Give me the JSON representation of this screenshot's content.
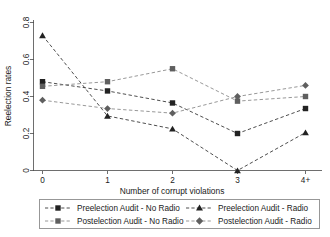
{
  "chart_data": {
    "type": "line",
    "title": "",
    "xlabel": "Number of corrupt violations",
    "ylabel": "Reelection rates",
    "categories": [
      "0",
      "1",
      "2",
      "3",
      "4+"
    ],
    "x": [
      0,
      1,
      2,
      3,
      4
    ],
    "xtick_labels": [
      "0",
      "1",
      "2",
      "3",
      "4+"
    ],
    "ytick_labels": [
      "0",
      "0.2",
      "0.4",
      "0.6",
      "0.8"
    ],
    "ytick_values": [
      0,
      0.2,
      0.4,
      0.6,
      0.8
    ],
    "ylim": [
      0,
      0.8
    ],
    "grid": false,
    "legend_position": "bottom",
    "series": [
      {
        "name": "Preelection Audit - No Radio",
        "marker": "square",
        "tone": "dark",
        "values": [
          0.48,
          0.43,
          0.365,
          0.2,
          0.335
        ]
      },
      {
        "name": "Preelection Audit - Radio",
        "marker": "triangle",
        "tone": "dark",
        "values": [
          0.73,
          0.295,
          0.225,
          0.0,
          0.205
        ]
      },
      {
        "name": "Postelection Audit - No Radio",
        "marker": "square",
        "tone": "light",
        "values": [
          0.455,
          0.48,
          0.55,
          0.375,
          0.4
        ]
      },
      {
        "name": "Postelection Audit - Radio",
        "marker": "diamond",
        "tone": "light",
        "values": [
          0.38,
          0.335,
          0.31,
          0.4,
          0.46
        ]
      }
    ]
  },
  "legend": {
    "entries": [
      {
        "label": "Preelection Audit - No Radio"
      },
      {
        "label": "Preelection Audit - Radio"
      },
      {
        "label": "Postelection Audit - No Radio"
      },
      {
        "label": "Postelection Audit - Radio"
      }
    ]
  },
  "axes": {
    "y_title": "Reelection rates",
    "x_title": "Number of corrupt violations"
  }
}
